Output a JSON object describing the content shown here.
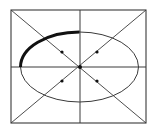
{
  "diagram": {
    "width": 152,
    "height": 127,
    "background": "#ffffff",
    "stroke_color": "#3a3a3a",
    "bold_stroke_color": "#111111",
    "rectangle": {
      "x1": 11,
      "y1": 10,
      "x2": 146,
      "y2": 123
    },
    "center": {
      "x": 80,
      "y": 67
    },
    "ellipse": {
      "cx": 79.5,
      "cy": 67,
      "rx": 59,
      "ry": 35
    },
    "bold_arc": {
      "from": "top",
      "to": "left",
      "quadrant": "upper-left",
      "thickness": 3
    },
    "points": [
      {
        "x": 62,
        "y": 52
      },
      {
        "x": 97,
        "y": 52
      },
      {
        "x": 62,
        "y": 81
      },
      {
        "x": 97,
        "y": 81
      },
      {
        "x": 80,
        "y": 67
      }
    ]
  }
}
